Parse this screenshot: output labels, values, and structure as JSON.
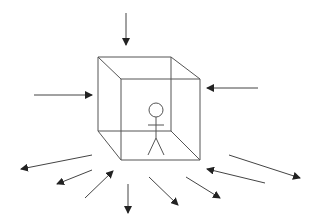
{
  "diagram": {
    "width": 316,
    "height": 224,
    "background": "#ffffff",
    "stroke_color": "#555555",
    "arrow_color": "#222222",
    "cube": {
      "back_face": [
        [
          98,
          57
        ],
        [
          171,
          57
        ],
        [
          171,
          131
        ],
        [
          98,
          131
        ]
      ],
      "front_face": [
        [
          121,
          79
        ],
        [
          200,
          79
        ],
        [
          200,
          160
        ],
        [
          121,
          160
        ]
      ],
      "edges": [
        [
          [
            98,
            57
          ],
          [
            121,
            79
          ]
        ],
        [
          [
            171,
            57
          ],
          [
            200,
            79
          ]
        ],
        [
          [
            171,
            131
          ],
          [
            200,
            160
          ]
        ],
        [
          [
            98,
            131
          ],
          [
            121,
            160
          ]
        ]
      ]
    },
    "stick_figure": {
      "head": {
        "cx": 156,
        "cy": 110,
        "r": 7
      },
      "body": [
        [
          156,
          117
        ],
        [
          156,
          138
        ]
      ],
      "arms": [
        [
          148,
          125
        ],
        [
          164,
          125
        ]
      ],
      "left_leg": [
        [
          156,
          138
        ],
        [
          148,
          155
        ]
      ],
      "right_leg": [
        [
          156,
          138
        ],
        [
          164,
          155
        ]
      ]
    },
    "arrows": [
      {
        "name": "arrow-top-inward",
        "from": [
          126,
          13
        ],
        "to": [
          126,
          45
        ]
      },
      {
        "name": "arrow-left-inward",
        "from": [
          34,
          95
        ],
        "to": [
          92,
          95
        ]
      },
      {
        "name": "arrow-right-inward",
        "from": [
          258,
          88
        ],
        "to": [
          207,
          88
        ]
      },
      {
        "name": "arrow-bottom-left-outward-1",
        "from": [
          92,
          155
        ],
        "to": [
          21,
          169
        ]
      },
      {
        "name": "arrow-bottom-left-outward-2",
        "from": [
          92,
          170
        ],
        "to": [
          57,
          184
        ]
      },
      {
        "name": "arrow-bottom-left-inward",
        "from": [
          85,
          198
        ],
        "to": [
          113,
          171
        ]
      },
      {
        "name": "arrow-bottom-outward",
        "from": [
          128,
          184
        ],
        "to": [
          128,
          213
        ]
      },
      {
        "name": "arrow-bottom-right-outward-1",
        "from": [
          149,
          177
        ],
        "to": [
          178,
          205
        ]
      },
      {
        "name": "arrow-bottom-right-outward-2",
        "from": [
          186,
          177
        ],
        "to": [
          220,
          198
        ]
      },
      {
        "name": "arrow-right-lower-outward",
        "from": [
          229,
          155
        ],
        "to": [
          300,
          178
        ]
      },
      {
        "name": "arrow-right-lower-inward",
        "from": [
          265,
          183
        ],
        "to": [
          207,
          169
        ]
      }
    ]
  }
}
